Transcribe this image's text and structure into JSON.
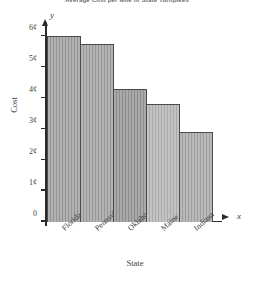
{
  "chart_data": {
    "type": "bar",
    "title": "Average Cost per Mile of State Turnpikes",
    "xlabel": "State",
    "ylabel": "Cost",
    "x_var": "x",
    "y_var": "y",
    "categories": [
      "Florida",
      "Pennsylvania",
      "Oklahoma",
      "Maine",
      "Indiana"
    ],
    "values": [
      6.0,
      5.75,
      4.3,
      3.8,
      2.9
    ],
    "value_labels": [
      "6¢",
      "5.75¢",
      "4.3¢",
      "3.8¢",
      "2.9¢"
    ],
    "ylim": [
      0,
      6.6
    ],
    "ytick_values": [
      0,
      1,
      2,
      3,
      4,
      5,
      6
    ],
    "ytick_labels": [
      "0",
      "1¢",
      "2¢",
      "3¢",
      "4¢",
      "5¢",
      "6¢"
    ],
    "grid": false,
    "legend": false,
    "bar_colors": [
      "#9d9d9d",
      "#a0a0a0",
      "#949494",
      "#b4b4b4",
      "#a8a8a8"
    ],
    "bar_edge_color": "#4a4a4a",
    "axis_color": "#2b2b2b",
    "text_color": "#3d3d3d",
    "background": "#ffffff"
  }
}
